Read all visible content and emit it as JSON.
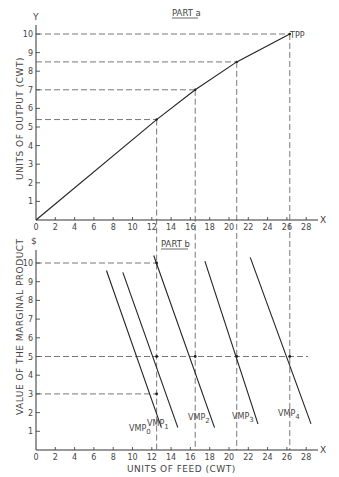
{
  "chart_data": [
    {
      "type": "line",
      "title": "PART a",
      "xlabel": "X",
      "ylabel": "UNITS OF OUTPUT (CWT)",
      "y_axis_letter": "Y",
      "x_axis_letter": "X",
      "xlim": [
        0,
        29
      ],
      "ylim": [
        0,
        10
      ],
      "x_ticks": [
        "0",
        "2",
        "4",
        "6",
        "8",
        "10",
        "12",
        "14",
        "16",
        "18",
        "20",
        "22",
        "24",
        "26",
        "28"
      ],
      "y_ticks": [
        "1",
        "2",
        "3",
        "4",
        "5",
        "6",
        "7",
        "8",
        "9",
        "10"
      ],
      "series": [
        {
          "name": "TPP",
          "x": [
            0,
            12.5,
            16.5,
            20.8,
            26.3
          ],
          "y": [
            0,
            5.4,
            7,
            8.5,
            10
          ]
        }
      ],
      "reference_lines": {
        "horizontal_y": [
          10,
          8.5,
          7,
          5.4
        ],
        "vertical_x": [
          12.5,
          16.5,
          20.8,
          26.3
        ]
      },
      "annotations": [
        "TPP"
      ],
      "grid": false
    },
    {
      "type": "line",
      "title": "PART b",
      "xlabel": "UNITS OF FEED (CWT)",
      "ylabel": "VALUE OF THE MARGINAL PRODUCT",
      "y_axis_letter": "$",
      "x_axis_letter": "X",
      "xlim": [
        0,
        29
      ],
      "ylim": [
        0,
        10.5
      ],
      "x_ticks": [
        "0",
        "2",
        "4",
        "6",
        "8",
        "10",
        "12",
        "14",
        "16",
        "18",
        "20",
        "22",
        "24",
        "26",
        "28"
      ],
      "y_ticks": [
        "1",
        "2",
        "3",
        "4",
        "5",
        "6",
        "7",
        "8",
        "9",
        "10"
      ],
      "series": [
        {
          "name": "VMP0",
          "x": [
            7.3,
            13.0
          ],
          "y": [
            9.6,
            1.2
          ]
        },
        {
          "name": "VMP1",
          "x": [
            9.0,
            14.7
          ],
          "y": [
            9.5,
            1.2
          ]
        },
        {
          "name": "VMP2",
          "x": [
            12.2,
            18.5
          ],
          "y": [
            10.4,
            1.2
          ]
        },
        {
          "name": "VMP3",
          "x": [
            17.5,
            23.0
          ],
          "y": [
            10.1,
            1.4
          ]
        },
        {
          "name": "VMP4",
          "x": [
            22.2,
            28.5
          ],
          "y": [
            10.3,
            1.4
          ]
        }
      ],
      "marked_points": [
        {
          "x": 12.5,
          "y": 10
        },
        {
          "x": 12.5,
          "y": 5
        },
        {
          "x": 12.5,
          "y": 3
        },
        {
          "x": 16.5,
          "y": 5
        },
        {
          "x": 20.8,
          "y": 5
        },
        {
          "x": 26.3,
          "y": 5
        }
      ],
      "reference_lines": {
        "horizontal_y": [
          10,
          5,
          3
        ],
        "vertical_x": [
          12.5,
          16.5,
          20.8,
          26.3
        ]
      },
      "legend": [
        "VMP0",
        "VMP1",
        "VMP2",
        "VMP3",
        "VMP4"
      ],
      "grid": false
    }
  ],
  "labels": {
    "part_a": "PART a",
    "part_b": "PART b",
    "y_letter": "Y",
    "dollar": "$",
    "x_letter_top": "X",
    "x_letter_bottom": "X",
    "ylabel_top": "UNITS OF OUTPUT (CWT)",
    "ylabel_bottom": "VALUE OF THE MARGINAL PRODUCT",
    "xlabel_bottom": "UNITS OF FEED (CWT)",
    "tpp": "TPP",
    "vmp": [
      "VMP",
      "VMP",
      "VMP",
      "VMP",
      "VMP"
    ],
    "vmp_sub": [
      "0",
      "1",
      "2",
      "3",
      "4"
    ],
    "x_ticks": [
      "0",
      "2",
      "4",
      "6",
      "8",
      "10",
      "12",
      "14",
      "16",
      "18",
      "20",
      "22",
      "24",
      "26",
      "28"
    ],
    "y_ticks": [
      "1",
      "2",
      "3",
      "4",
      "5",
      "6",
      "7",
      "8",
      "9",
      "10"
    ]
  }
}
